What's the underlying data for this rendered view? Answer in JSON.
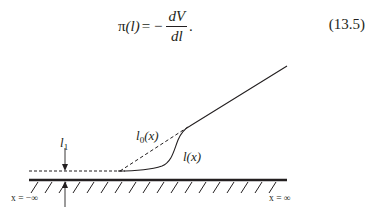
{
  "equation": {
    "lhs_symbol": "π",
    "lhs_arg": "(l)",
    "equals": " = −",
    "numerator": "dV",
    "denominator": "dl",
    "trailing": ".",
    "number": "(13.5)"
  },
  "figure": {
    "labels": {
      "film_thickness": "l",
      "film_thickness_sub": "1",
      "tangent_curve": "l",
      "tangent_curve_sub": "0",
      "tangent_curve_arg": "(x)",
      "profile_curve": "l(x)",
      "left_limit": "x = −∞",
      "right_limit": "x = ∞"
    },
    "colors": {
      "ink": "#231f20",
      "background": "#ffffff"
    }
  }
}
